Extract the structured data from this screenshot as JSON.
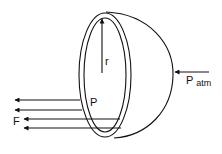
{
  "diagram": {
    "labels": {
      "radius": "r",
      "pressure_inside": "P",
      "force": "F",
      "pressure_atm_main": "P",
      "pressure_atm_sub": "atm"
    },
    "colors": {
      "stroke": "#111111",
      "background": "#ffffff"
    },
    "elements": {
      "hemisphere": "hemisphere shell with rim (double ellipse)",
      "radius_arrow": "vertical arrow from center to inner rim top",
      "atm_arrow": "arrow pointing left toward hemisphere",
      "force_arrows_count": 4
    }
  }
}
